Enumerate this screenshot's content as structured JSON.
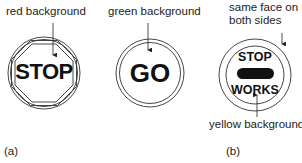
{
  "figure": {
    "panel_a": {
      "caption": "(a)",
      "signs": [
        {
          "id": "stop-sign",
          "shape": "octagon-in-circle",
          "text": "STOP",
          "annotation": "red background",
          "background_color": "#d62828"
        },
        {
          "id": "go-sign",
          "shape": "circle",
          "text": "GO",
          "annotation": "green background",
          "background_color": "#2e9e3e"
        }
      ]
    },
    "panel_b": {
      "caption": "(b)",
      "sign": {
        "id": "stop-works-sign",
        "shape": "circle",
        "top_text": "STOP",
        "bottom_text": "WORKS",
        "annotation_top_line1": "same face on",
        "annotation_top_line2": "both sides",
        "annotation_bottom": "yellow background",
        "background_color": "#f2c200"
      }
    }
  }
}
